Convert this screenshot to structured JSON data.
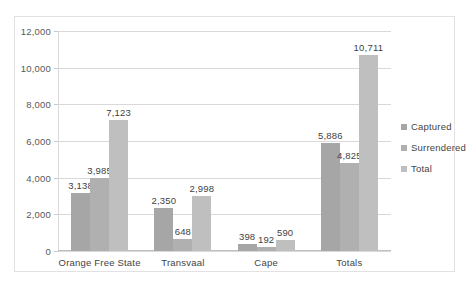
{
  "chart_data": {
    "type": "bar",
    "title": "",
    "subtitle": "",
    "xlabel": "",
    "ylabel": "",
    "grid": true,
    "legend_position": "right",
    "ylim": [
      0,
      12000
    ],
    "yticks": [
      "0",
      "2,000",
      "4,000",
      "6,000",
      "8,000",
      "10,000",
      "12,000"
    ],
    "ytick_values": [
      0,
      2000,
      4000,
      6000,
      8000,
      10000,
      12000
    ],
    "categories": [
      "Orange Free State",
      "Transvaal",
      "Cape",
      "Totals"
    ],
    "series": [
      {
        "name": "Captured",
        "color": "#a6a6a6",
        "values": [
          3138,
          2350,
          398,
          5886
        ],
        "labels": [
          "3,138",
          "2,350",
          "398",
          "5,886"
        ]
      },
      {
        "name": "Surrendered",
        "color": "#b0b0b0",
        "values": [
          3985,
          648,
          192,
          4825
        ],
        "labels": [
          "3,985",
          "648",
          "192",
          "4,825"
        ]
      },
      {
        "name": "Total",
        "color": "#bfbfbf",
        "values": [
          7123,
          2998,
          590,
          10711
        ],
        "labels": [
          "7,123",
          "2,998",
          "590",
          "10,711"
        ]
      }
    ]
  },
  "style": {
    "plot_background": "#ffffff",
    "gridline_color": "#d9d9d9",
    "frame_border_color": "#e2e2e2",
    "text_color": "#444444"
  }
}
